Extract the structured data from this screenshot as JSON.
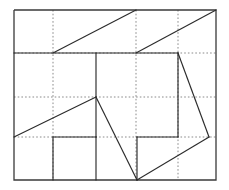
{
  "figure": {
    "canvas": {
      "width": 229,
      "height": 190
    },
    "frame": {
      "left": 14,
      "top": 10,
      "right": 216,
      "bottom": 180
    },
    "colors": {
      "solid_stroke": "#2b2b2b",
      "border_stroke": "#3a3a3a",
      "dotted_stroke": "#8a8a8a",
      "background": "#ffffff"
    },
    "grid": {
      "vertical_dotted_x": [
        53,
        136,
        178
      ],
      "horizontal_dotted_y": [
        97,
        137
      ],
      "style": "dotted"
    },
    "outer_border": {
      "label": "outer rectangle",
      "points": "14,10 216,10 216,180 14,180 14,10"
    },
    "solid_segments": [
      {
        "name": "upper-band-divider",
        "x1": 14,
        "y1": 53,
        "x2": 178,
        "y2": 53
      },
      {
        "name": "top-left-diagonal",
        "x1": 53,
        "y1": 53,
        "x2": 136,
        "y2": 10
      },
      {
        "name": "top-right-diagonal",
        "x1": 136,
        "y1": 53,
        "x2": 216,
        "y2": 10
      },
      {
        "name": "center-vertical",
        "x1": 96,
        "y1": 53,
        "x2": 96,
        "y2": 137
      },
      {
        "name": "right-inner-vertical",
        "x1": 178,
        "y1": 53,
        "x2": 178,
        "y2": 137
      },
      {
        "name": "right-diagonal",
        "x1": 178,
        "y1": 53,
        "x2": 209,
        "y2": 137
      },
      {
        "name": "left-long-diagonal",
        "x1": 14,
        "y1": 137,
        "x2": 96,
        "y2": 97
      },
      {
        "name": "center-down-diagonal",
        "x1": 96,
        "y1": 97,
        "x2": 137,
        "y2": 180
      },
      {
        "name": "inner-horizontal-left",
        "x1": 53,
        "y1": 137,
        "x2": 96,
        "y2": 137
      },
      {
        "name": "inner-horizontal-right",
        "x1": 137,
        "y1": 137,
        "x2": 178,
        "y2": 137
      },
      {
        "name": "small-box-left-vertical",
        "x1": 53,
        "y1": 137,
        "x2": 53,
        "y2": 180
      },
      {
        "name": "small-box-right-vertical",
        "x1": 96,
        "y1": 137,
        "x2": 96,
        "y2": 180
      },
      {
        "name": "lower-inner-vertical",
        "x1": 137,
        "y1": 137,
        "x2": 137,
        "y2": 180
      },
      {
        "name": "bottom-right-diagonal",
        "x1": 137,
        "y1": 180,
        "x2": 209,
        "y2": 137
      }
    ],
    "dotted_segments": [
      {
        "name": "dotted-vertical-1",
        "x1": 53,
        "y1": 10,
        "x2": 53,
        "y2": 180
      },
      {
        "name": "dotted-vertical-2",
        "x1": 136,
        "y1": 10,
        "x2": 136,
        "y2": 180
      },
      {
        "name": "dotted-vertical-3",
        "x1": 178,
        "y1": 10,
        "x2": 178,
        "y2": 180
      },
      {
        "name": "dotted-horizontal-1",
        "x1": 14,
        "y1": 53,
        "x2": 216,
        "y2": 53
      },
      {
        "name": "dotted-horizontal-2",
        "x1": 14,
        "y1": 97,
        "x2": 216,
        "y2": 97
      },
      {
        "name": "dotted-horizontal-3",
        "x1": 14,
        "y1": 137,
        "x2": 216,
        "y2": 137
      }
    ]
  }
}
